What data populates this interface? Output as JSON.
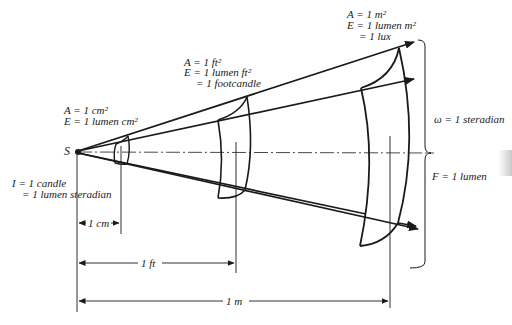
{
  "diagram": {
    "source_label": "S",
    "intensity": {
      "line1": "I = 1 candle",
      "line2": "= 1 lumen steradian"
    },
    "cm_area": {
      "line1": "A = 1 cm²",
      "line2": "E = 1 lumen cm²"
    },
    "ft_area": {
      "line1": "A = 1 ft²",
      "line2": "E = 1 lumen ft²",
      "line3": "= 1 footcandle"
    },
    "m_area": {
      "line1": "A = 1 m²",
      "line2": "E = 1 lumen m²",
      "line3": "= 1 lux"
    },
    "solid_angle": "ω = 1 steradian",
    "flux": "F = 1 lumen",
    "dimensions": {
      "cm": "1 cm",
      "ft": "1 ft",
      "m": "1 m"
    },
    "colors": {
      "line": "#1a1a1a",
      "background": "#ffffff"
    }
  }
}
